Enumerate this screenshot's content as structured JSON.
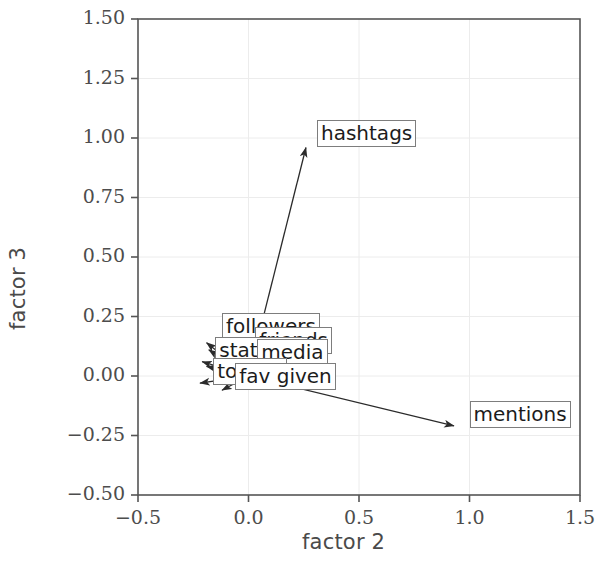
{
  "chart_data": {
    "type": "scatter",
    "title": "",
    "xlabel": "factor 2",
    "ylabel": "factor 3",
    "xlim": [
      -0.5,
      1.5
    ],
    "ylim": [
      -0.5,
      1.5
    ],
    "xticks": [
      "-0.5",
      "0.0",
      "0.5",
      "1.0",
      "1.5"
    ],
    "xtick_values": [
      -0.5,
      0.0,
      0.5,
      1.0,
      1.5
    ],
    "yticks": [
      "1.50",
      "1.25",
      "1.00",
      "0.75",
      "0.50",
      "0.25",
      "0.00",
      "-0.25",
      "-0.50"
    ],
    "ytick_values": [
      1.5,
      1.25,
      1.0,
      0.75,
      0.5,
      0.25,
      0.0,
      -0.25,
      -0.5
    ],
    "grid": true,
    "legend": "none",
    "origin": [
      0.0,
      0.0
    ],
    "points": [
      {
        "name": "hashtags",
        "x": 0.26,
        "y": 0.96,
        "label": "hashtags",
        "label_x": 0.31,
        "label_y": 1.02
      },
      {
        "name": "mentions",
        "x": 0.93,
        "y": -0.21,
        "label": "mentions",
        "label_x": 1.0,
        "label_y": -0.16
      },
      {
        "name": "followers",
        "x": -0.19,
        "y": 0.14,
        "label": "followers",
        "label_x": -0.12,
        "label_y": 0.21
      },
      {
        "name": "friends",
        "x": -0.18,
        "y": 0.11,
        "label": "friends",
        "label_x": 0.03,
        "label_y": 0.15
      },
      {
        "name": "statuses",
        "x": -0.21,
        "y": 0.06,
        "label": "statuses",
        "label_x": -0.15,
        "label_y": 0.11
      },
      {
        "name": "media",
        "x": -0.19,
        "y": 0.04,
        "label": "media",
        "label_x": 0.04,
        "label_y": 0.1
      },
      {
        "name": "tokens",
        "x": -0.22,
        "y": -0.03,
        "label": "tokens",
        "label_x": -0.16,
        "label_y": 0.02
      },
      {
        "name": "fav given",
        "x": -0.12,
        "y": -0.06,
        "label": "fav given",
        "label_x": -0.06,
        "label_y": 0.0
      }
    ],
    "colors": {
      "axis": "#555555",
      "grid": "#ececec",
      "arrow": "#2b2b2b",
      "label_border": "#7d7d7d",
      "text": "#1c1c1c",
      "background": "#ffffff"
    }
  },
  "axes": {
    "xlabel": "factor 2",
    "ylabel": "factor 3"
  }
}
